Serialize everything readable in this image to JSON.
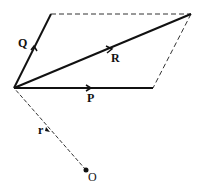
{
  "diagram": {
    "labels": {
      "Q": "Q",
      "R": "R",
      "P": "P",
      "r": "r",
      "O": "O"
    },
    "colors": {
      "stroke": "#111111",
      "background": "#ffffff"
    }
  }
}
